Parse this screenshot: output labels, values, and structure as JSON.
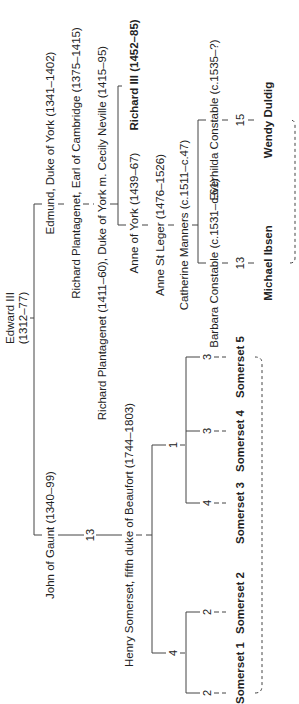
{
  "diagram": {
    "type": "family-tree",
    "orientation": "rotated-90-ccw",
    "root": {
      "name": "Edward III",
      "dates": "(1312–77)"
    },
    "york_line": [
      {
        "label": "Edmund, Duke of York (1341–1402)"
      },
      {
        "label": "Richard Plantagenet, Earl of Cambridge (1375–1415)"
      },
      {
        "label": "Richard Plantagenet (1411–60), Duke of York m. Cecily Neville (1415–95)"
      },
      {
        "label": "Anne of York (1439–67)"
      },
      {
        "label": "Richard III (1452–85)",
        "bold": true
      },
      {
        "label": "Anne St Leger (1476–1526)"
      },
      {
        "label": "Catherine Manners (c.1511–c.47)"
      },
      {
        "label": "Barbara Constable (c.1531–c.61)"
      },
      {
        "label": "Everhilda Constable (c.1535–?)"
      },
      {
        "label": "Michael Ibsen",
        "bold": true,
        "generations": "13"
      },
      {
        "label": "Wendy Duldig",
        "bold": true,
        "generations": "15"
      }
    ],
    "gaunt_line": [
      {
        "label": "John of Gaunt (1340–99)"
      },
      {
        "label": "Henry Somerset, fifth duke of Beaufort (1744–1803)",
        "generations": "13"
      },
      {
        "label": "Somerset 1",
        "bold": true,
        "generations": "2"
      },
      {
        "label": "Somerset 2",
        "bold": true,
        "generations": "2"
      },
      {
        "label": "Somerset 3",
        "bold": true,
        "generations": "4"
      },
      {
        "label": "Somerset 4",
        "bold": true,
        "generations": "3"
      },
      {
        "label": "Somerset 5",
        "bold": true,
        "generations": "3"
      }
    ],
    "branch_numbers": {
      "beaufort_left": "4",
      "beaufort_right": "1"
    }
  }
}
